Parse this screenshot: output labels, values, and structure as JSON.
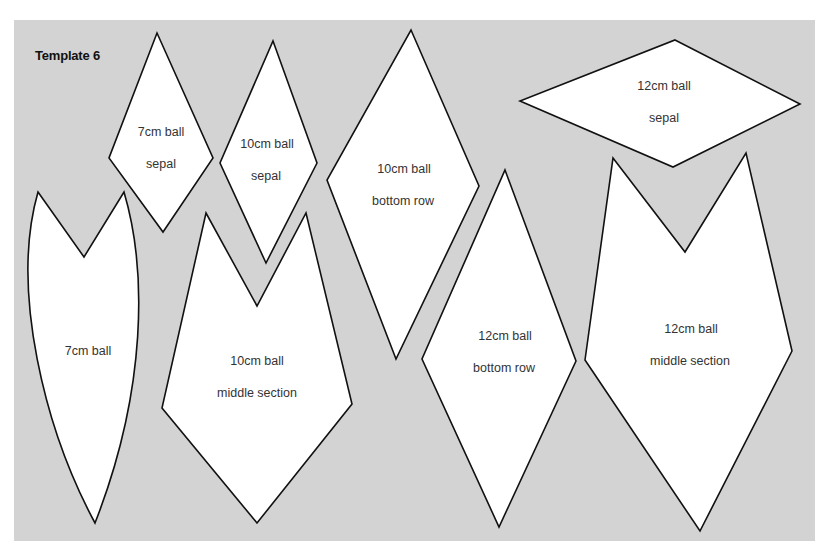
{
  "title": "Template 6",
  "colors": {
    "background": "#d3d3d3",
    "piece_fill": "#ffffff",
    "outline": "#111111",
    "label_text": "#333333"
  },
  "pieces": [
    {
      "id": "7cm-sepal",
      "lines": [
        "7cm ball",
        "sepal"
      ],
      "shape": "diamond"
    },
    {
      "id": "10cm-sepal",
      "lines": [
        "10cm ball",
        "sepal"
      ],
      "shape": "diamond"
    },
    {
      "id": "10cm-bottom-row",
      "lines": [
        "10cm ball",
        "bottom row"
      ],
      "shape": "diamond"
    },
    {
      "id": "12cm-sepal",
      "lines": [
        "12cm ball",
        "sepal"
      ],
      "shape": "diamond"
    },
    {
      "id": "7cm-ball",
      "lines": [
        "7cm ball"
      ],
      "shape": "curved-petal-with-notch"
    },
    {
      "id": "10cm-middle-section",
      "lines": [
        "10cm ball",
        "middle section"
      ],
      "shape": "notched-pentagon"
    },
    {
      "id": "12cm-bottom-row",
      "lines": [
        "12cm ball",
        "bottom row"
      ],
      "shape": "diamond"
    },
    {
      "id": "12cm-middle-section",
      "lines": [
        "12cm ball",
        "middle section"
      ],
      "shape": "notched-pentagon"
    }
  ]
}
